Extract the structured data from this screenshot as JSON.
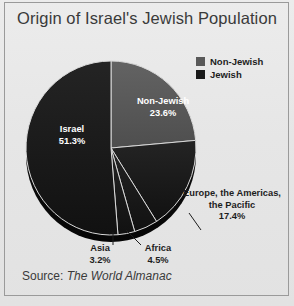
{
  "chart_data": {
    "type": "pie",
    "title": "Origin of Israel's Jewish Population",
    "categories": [
      "Non-Jewish",
      "Europe, the Americas, the Pacific",
      "Africa",
      "Asia",
      "Israel"
    ],
    "values": [
      23.6,
      17.4,
      4.5,
      3.2,
      51.3
    ],
    "value_labels": [
      "23.6%",
      "17.4%",
      "4.5%",
      "3.2%",
      "51.3%"
    ],
    "unit": "%",
    "start_angle_deg": 0,
    "direction": "clockwise",
    "grid": false,
    "xlabel": "",
    "ylabel": "",
    "legend_position": "top-right",
    "legend": [
      {
        "label": "Non-Jewish",
        "color": "#595959"
      },
      {
        "label": "Jewish",
        "color": "#1a1a1a"
      }
    ],
    "slices": [
      {
        "name": "Non-Jewish",
        "label": "Non-Jewish",
        "percent_label": "23.6%",
        "value": 23.6,
        "color": "#595959",
        "group": "Non-Jewish",
        "label_placement": "inside"
      },
      {
        "name": "Europe, the Americas, the Pacific",
        "label": "Europe, the Americas,\nthe Pacific",
        "percent_label": "17.4%",
        "value": 17.4,
        "color": "#1a1a1a",
        "group": "Jewish",
        "label_placement": "outside"
      },
      {
        "name": "Africa",
        "label": "Africa",
        "percent_label": "4.5%",
        "value": 4.5,
        "color": "#1a1a1a",
        "group": "Jewish",
        "label_placement": "outside"
      },
      {
        "name": "Asia",
        "label": "Asia",
        "percent_label": "3.2%",
        "value": 3.2,
        "color": "#1a1a1a",
        "group": "Jewish",
        "label_placement": "outside"
      },
      {
        "name": "Israel",
        "label": "Israel",
        "percent_label": "51.3%",
        "value": 51.3,
        "color": "#1a1a1a",
        "group": "Jewish",
        "label_placement": "inside"
      }
    ]
  },
  "labels": {
    "israel_name": "Israel",
    "israel_pct": "51.3%",
    "nonjewish_name": "Non-Jewish",
    "nonjewish_pct": "23.6%",
    "europe_line1": "Europe, the Americas,",
    "europe_line2": "the Pacific",
    "europe_pct": "17.4%",
    "asia_name": "Asia",
    "asia_pct": "3.2%",
    "africa_name": "Africa",
    "africa_pct": "4.5%"
  },
  "legend": {
    "items": [
      {
        "label": "Non-Jewish",
        "color": "#595959"
      },
      {
        "label": "Jewish",
        "color": "#1a1a1a"
      }
    ]
  },
  "source": {
    "prefix": "Source: ",
    "work": "The World Almanac"
  },
  "colors": {
    "non_jewish": "#595959",
    "jewish": "#1a1a1a",
    "background": "#e8e8e8",
    "frame": "#9a9a9a",
    "title_text": "#3a3a3a",
    "label_on_slice": "#ffffff",
    "label_outside": "#1d1d1d"
  }
}
